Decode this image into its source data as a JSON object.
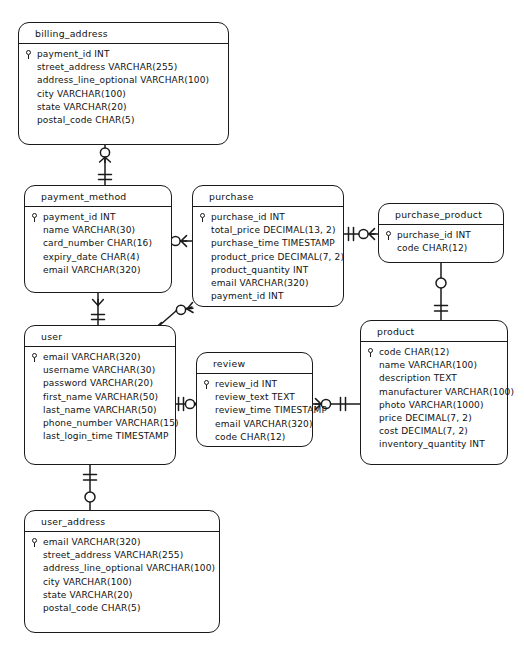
{
  "diagram": {
    "kind": "entity-relationship-diagram",
    "notation": "crow's foot",
    "background_color": "#ffffff",
    "stroke_color": "#1a1a1a"
  },
  "entities": [
    {
      "id": "billing_address",
      "name": "billing_address",
      "x": 18,
      "y": 22,
      "width": 211,
      "height": 123,
      "attributes": [
        {
          "text": "payment_id INT",
          "pk": true
        },
        {
          "text": "street_address VARCHAR(255)",
          "pk": false
        },
        {
          "text": "address_line_optional VARCHAR(100)",
          "pk": false
        },
        {
          "text": "city VARCHAR(100)",
          "pk": false
        },
        {
          "text": "state VARCHAR(20)",
          "pk": false
        },
        {
          "text": "postal_code CHAR(5)",
          "pk": false
        }
      ]
    },
    {
      "id": "payment_method",
      "name": "payment_method",
      "x": 24,
      "y": 185,
      "width": 148,
      "height": 108,
      "attributes": [
        {
          "text": "payment_id INT",
          "pk": true
        },
        {
          "text": "name VARCHAR(30)",
          "pk": false
        },
        {
          "text": "card_number CHAR(16)",
          "pk": false
        },
        {
          "text": "expiry_date CHAR(4)",
          "pk": false
        },
        {
          "text": "email VARCHAR(320)",
          "pk": false
        }
      ]
    },
    {
      "id": "purchase",
      "name": "purchase",
      "x": 192,
      "y": 185,
      "width": 152,
      "height": 122,
      "attributes": [
        {
          "text": "purchase_id INT",
          "pk": true
        },
        {
          "text": "total_price DECIMAL(13, 2)",
          "pk": false
        },
        {
          "text": "purchase_time TIMESTAMP",
          "pk": false
        },
        {
          "text": "product_price DECIMAL(7, 2)",
          "pk": false
        },
        {
          "text": "product_quantity INT",
          "pk": false
        },
        {
          "text": "email VARCHAR(320)",
          "pk": false
        },
        {
          "text": "payment_id INT",
          "pk": false
        }
      ]
    },
    {
      "id": "purchase_product",
      "name": "purchase_product",
      "x": 378,
      "y": 203,
      "width": 126,
      "height": 60,
      "attributes": [
        {
          "text": "purchase_id INT",
          "pk": true
        },
        {
          "text": "code CHAR(12)",
          "pk": false
        }
      ]
    },
    {
      "id": "user",
      "name": "user",
      "x": 24,
      "y": 325,
      "width": 152,
      "height": 140,
      "attributes": [
        {
          "text": "email VARCHAR(320)",
          "pk": true
        },
        {
          "text": "username VARCHAR(30)",
          "pk": false
        },
        {
          "text": "password VARCHAR(20)",
          "pk": false
        },
        {
          "text": "first_name VARCHAR(50)",
          "pk": false
        },
        {
          "text": "last_name VARCHAR(50)",
          "pk": false
        },
        {
          "text": "phone_number VARCHAR(15)",
          "pk": false
        },
        {
          "text": "last_login_time TIMESTAMP",
          "pk": false
        }
      ]
    },
    {
      "id": "review",
      "name": "review",
      "x": 196,
      "y": 352,
      "width": 117,
      "height": 95,
      "attributes": [
        {
          "text": "review_id INT",
          "pk": true
        },
        {
          "text": "review_text TEXT",
          "pk": false
        },
        {
          "text": "review_time TIMESTAMP",
          "pk": false
        },
        {
          "text": "email VARCHAR(320)",
          "pk": false
        },
        {
          "text": "code CHAR(12)",
          "pk": false
        }
      ]
    },
    {
      "id": "product",
      "name": "product",
      "x": 360,
      "y": 320,
      "width": 148,
      "height": 145,
      "attributes": [
        {
          "text": "code CHAR(12)",
          "pk": true
        },
        {
          "text": "name VARCHAR(100)",
          "pk": false
        },
        {
          "text": "description TEXT",
          "pk": false
        },
        {
          "text": "manufacturer VARCHAR(100)",
          "pk": false
        },
        {
          "text": "photo VARCHAR(1000)",
          "pk": false
        },
        {
          "text": "price DECIMAL(7, 2)",
          "pk": false
        },
        {
          "text": "cost DECIMAL(7, 2)",
          "pk": false
        },
        {
          "text": "inventory_quantity INT",
          "pk": false
        }
      ]
    },
    {
      "id": "user_address",
      "name": "user_address",
      "x": 24,
      "y": 510,
      "width": 196,
      "height": 123,
      "attributes": [
        {
          "text": "email VARCHAR(320)",
          "pk": true
        },
        {
          "text": "street_address VARCHAR(255)",
          "pk": false
        },
        {
          "text": "address_line_optional VARCHAR(100)",
          "pk": false
        },
        {
          "text": "city VARCHAR(100)",
          "pk": false
        },
        {
          "text": "state VARCHAR(20)",
          "pk": false
        },
        {
          "text": "postal_code CHAR(5)",
          "pk": false
        }
      ]
    }
  ],
  "relationships": [
    {
      "id": "billing_address-payment_method",
      "from": "billing_address",
      "to": "payment_method",
      "from_cardinality": "zero-or-more",
      "to_cardinality": "exactly-one"
    },
    {
      "id": "payment_method-user",
      "from": "payment_method",
      "to": "user",
      "from_cardinality": "many",
      "to_cardinality": "exactly-one"
    },
    {
      "id": "payment_method-purchase",
      "from": "payment_method",
      "to": "purchase",
      "from_cardinality": "exactly-one",
      "to_cardinality": "zero-or-more"
    },
    {
      "id": "purchase-purchase_product",
      "from": "purchase",
      "to": "purchase_product",
      "from_cardinality": "exactly-one",
      "to_cardinality": "zero-or-more"
    },
    {
      "id": "user-purchase",
      "from": "user",
      "to": "purchase",
      "from_cardinality": "exactly-one",
      "to_cardinality": "zero-or-more"
    },
    {
      "id": "user-review",
      "from": "user",
      "to": "review",
      "from_cardinality": "exactly-one",
      "to_cardinality": "zero-or-more"
    },
    {
      "id": "review-product",
      "from": "review",
      "to": "product",
      "from_cardinality": "zero-or-more",
      "to_cardinality": "exactly-one"
    },
    {
      "id": "purchase_product-product",
      "from": "purchase_product",
      "to": "product",
      "from_cardinality": "zero-or-one",
      "to_cardinality": "exactly-one"
    },
    {
      "id": "user-user_address",
      "from": "user",
      "to": "user_address",
      "from_cardinality": "exactly-one",
      "to_cardinality": "zero-or-one"
    }
  ]
}
